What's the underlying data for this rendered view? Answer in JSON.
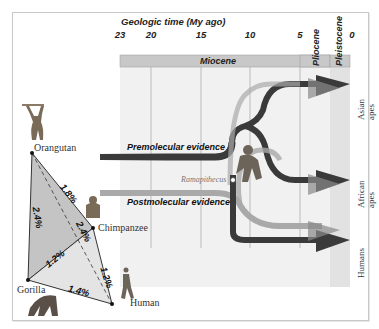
{
  "timeline": {
    "axis_title": "Geologic time (My ago)",
    "ticks": [
      {
        "label": "23",
        "x": 120
      },
      {
        "label": "20",
        "x": 151
      },
      {
        "label": "15",
        "x": 201
      },
      {
        "label": "10",
        "x": 250
      },
      {
        "label": "5",
        "x": 300
      },
      {
        "label": "0",
        "x": 350
      }
    ],
    "epochs": {
      "miocene": "Miocene",
      "pliocene": "Pliocene",
      "pleistocene": "Pleistocene"
    }
  },
  "lineage": {
    "premolecular_label": "Premolecular evidence",
    "postmolecular_label": "Postmolecular evidence",
    "fossil_label": "Ramapithecus",
    "outcomes": {
      "asian": "Asian apes",
      "african": "African apes",
      "humans": "Humans"
    }
  },
  "triangle": {
    "species": {
      "orangutan": "Orangutan",
      "chimpanzee": "Chimpanzee",
      "gorilla": "Gorilla",
      "human": "Human"
    },
    "distances": {
      "orangutan_chimp": "1.8%",
      "orangutan_gorilla": "2.4%",
      "orangutan_human": "2.4%",
      "gorilla_chimp": "1.2%",
      "chimp_human": "1.2%",
      "gorilla_human": "1.4%"
    }
  },
  "colors": {
    "dark_path": "#3a3a3a",
    "light_path": "#a9a9a9",
    "epoch_bar": "#c8c8c8",
    "panel_bg": "#f1f1f1"
  }
}
